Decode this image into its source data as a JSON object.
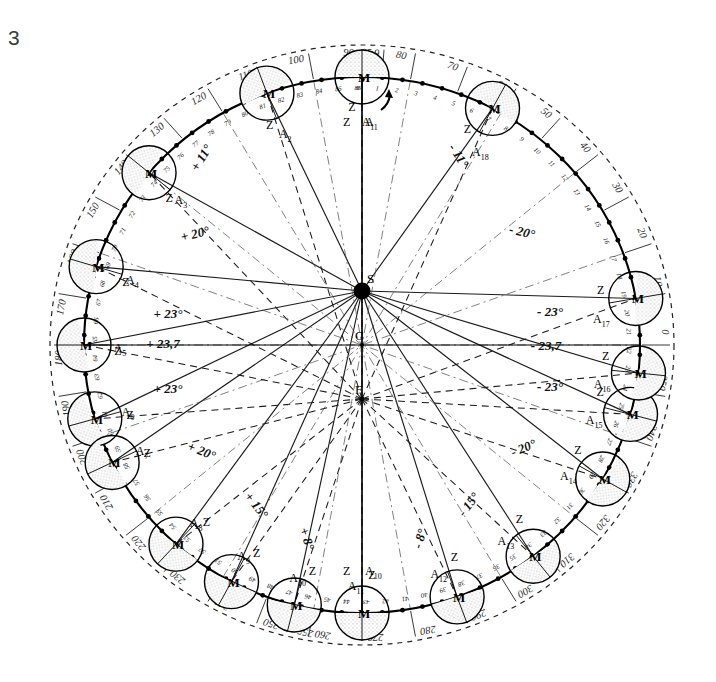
{
  "figure": {
    "number": "3",
    "caption_number": "3"
  },
  "focal_points": [
    {
      "id": "S",
      "label": "S",
      "x": 362,
      "y": 291,
      "kind": "sun",
      "filled": true
    },
    {
      "id": "C",
      "label": "C",
      "x": 362,
      "y": 345,
      "kind": "center",
      "filled": false
    },
    {
      "id": "F",
      "label": "F",
      "x": 362,
      "y": 399,
      "kind": "focus",
      "filled": false
    }
  ],
  "orbit": {
    "cx": 362,
    "cy": 345,
    "rx": 278,
    "ry": 268,
    "outer_dashed_rx": 312,
    "outer_dashed_ry": 300
  },
  "angle_rays": {
    "left": [
      "+ 11°",
      "+ 20°",
      "+ 23°",
      "+ 23,7",
      "+ 23°",
      "+ 20°",
      "+ 15°",
      "+ 8°"
    ],
    "right": [
      "- 11°",
      "- 20°",
      "- 23°",
      "- 23,7",
      "- 23°",
      "- 20°",
      "- 15°",
      "- 8°"
    ],
    "values_left": [
      {
        "text": "+ 11°",
        "x": 205,
        "y": 160,
        "rot": -58
      },
      {
        "text": "+ 20°",
        "x": 196,
        "y": 238,
        "rot": -14
      },
      {
        "text": "+ 23°",
        "x": 168,
        "y": 318,
        "rot": 0
      },
      {
        "text": "+ 23,7",
        "x": 163,
        "y": 348,
        "rot": 0
      },
      {
        "text": "+ 23°",
        "x": 168,
        "y": 393,
        "rot": 0
      },
      {
        "text": "+ 20°",
        "x": 200,
        "y": 455,
        "rot": 22
      },
      {
        "text": "+ 15°",
        "x": 253,
        "y": 508,
        "rot": 52
      },
      {
        "text": "+ 8°",
        "x": 303,
        "y": 540,
        "rot": 72
      }
    ],
    "values_right": [
      {
        "text": "- 11°",
        "x": 455,
        "y": 158,
        "rot": 58
      },
      {
        "text": "- 20°",
        "x": 521,
        "y": 236,
        "rot": 14
      },
      {
        "text": "- 23°",
        "x": 550,
        "y": 316,
        "rot": 0
      },
      {
        "text": "- 23,7",
        "x": 546,
        "y": 350,
        "rot": 0
      },
      {
        "text": "- 23°",
        "x": 550,
        "y": 391,
        "rot": 0
      },
      {
        "text": "- 20°",
        "x": 525,
        "y": 452,
        "rot": -22
      },
      {
        "text": "- 15°",
        "x": 472,
        "y": 507,
        "rot": -52
      },
      {
        "text": "- 8°",
        "x": 424,
        "y": 540,
        "rot": -72
      }
    ]
  },
  "graduations": {
    "unit": "degrees",
    "labels": [
      "0",
      "10",
      "20",
      "30",
      "40",
      "50",
      "60",
      "70",
      "80",
      "85,9",
      "90",
      "100",
      "110",
      "120",
      "130",
      "140",
      "150",
      "160",
      "170",
      "180",
      "190",
      "200",
      "210",
      "220",
      "230",
      "240",
      "250",
      "255,9",
      "260",
      "270",
      "280",
      "290",
      "300",
      "310",
      "320",
      "330",
      "340",
      "350"
    ],
    "special": [
      "85,9",
      "255,9"
    ],
    "ring_entries": [
      {
        "text": "90",
        "deg": 90
      },
      {
        "text": "85,9",
        "deg": 85.9
      },
      {
        "text": "80",
        "deg": 80
      },
      {
        "text": "70",
        "deg": 70
      },
      {
        "text": "60",
        "deg": 60
      },
      {
        "text": "50",
        "deg": 50
      },
      {
        "text": "40",
        "deg": 40
      },
      {
        "text": "30",
        "deg": 30
      },
      {
        "text": "20",
        "deg": 20
      },
      {
        "text": "10",
        "deg": 10
      },
      {
        "text": "0",
        "deg": 0
      },
      {
        "text": "350",
        "deg": 350
      },
      {
        "text": "340",
        "deg": 340
      },
      {
        "text": "330",
        "deg": 330
      },
      {
        "text": "320",
        "deg": 320
      },
      {
        "text": "310",
        "deg": 310
      },
      {
        "text": "300",
        "deg": 300
      },
      {
        "text": "290",
        "deg": 290
      },
      {
        "text": "280",
        "deg": 280
      },
      {
        "text": "270",
        "deg": 270
      },
      {
        "text": "260",
        "deg": 260
      },
      {
        "text": "255,9",
        "deg": 255.9
      },
      {
        "text": "250",
        "deg": 250
      },
      {
        "text": "240",
        "deg": 240
      },
      {
        "text": "230",
        "deg": 230
      },
      {
        "text": "220",
        "deg": 220
      },
      {
        "text": "210",
        "deg": 210
      },
      {
        "text": "200",
        "deg": 200
      },
      {
        "text": "190",
        "deg": 190
      },
      {
        "text": "180",
        "deg": 180
      },
      {
        "text": "170",
        "deg": 170
      },
      {
        "text": "160",
        "deg": 160
      },
      {
        "text": "150",
        "deg": 150
      },
      {
        "text": "140",
        "deg": 140
      },
      {
        "text": "130",
        "deg": 130
      },
      {
        "text": "120",
        "deg": 120
      },
      {
        "text": "110",
        "deg": 110
      },
      {
        "text": "100",
        "deg": 100
      }
    ]
  },
  "bodies": {
    "count": 18,
    "moon_letter": "M",
    "zenith_letter": "Z",
    "apex_letter": "A",
    "positions": [
      {
        "index": 1,
        "a_label": "A",
        "a_sub": "1",
        "deg": 90,
        "tick": "0"
      },
      {
        "index": 2,
        "a_label": "A",
        "a_sub": "2",
        "deg": 110,
        "tick": "5"
      },
      {
        "index": 3,
        "a_label": "A",
        "a_sub": "3",
        "deg": 140,
        "tick": "11"
      },
      {
        "index": 4,
        "a_label": "A",
        "a_sub": "4",
        "deg": 163,
        "tick": "17"
      },
      {
        "index": 5,
        "a_label": "A",
        "a_sub": "5",
        "deg": 180,
        "tick": "20"
      },
      {
        "index": 6,
        "a_label": "A",
        "a_sub": "6",
        "deg": 196,
        "tick": "22"
      },
      {
        "index": 7,
        "a_label": "A",
        "a_sub": "7",
        "deg": 206,
        "tick": "26"
      },
      {
        "index": 8,
        "a_label": "A",
        "a_sub": "8",
        "deg": 228,
        "tick": "33"
      },
      {
        "index": 9,
        "a_label": "A",
        "a_sub": "9",
        "deg": 242,
        "tick": "38"
      },
      {
        "index": 10,
        "a_label": "A",
        "a_sub": "10",
        "deg": 255.9,
        "tick": "44"
      },
      {
        "index": 11,
        "a_label": "A",
        "a_sub": "11",
        "deg": 270,
        "tick": "50"
      },
      {
        "index": 12,
        "a_label": "A",
        "a_sub": "12",
        "deg": 290,
        "tick": "55"
      },
      {
        "index": 13,
        "a_label": "A",
        "a_sub": "13",
        "deg": 308,
        "tick": "61"
      },
      {
        "index": 14,
        "a_label": "A",
        "a_sub": "14",
        "deg": 330,
        "tick": "66"
      },
      {
        "index": 15,
        "a_label": "A",
        "a_sub": "15",
        "deg": 345,
        "tick": "69"
      },
      {
        "index": 16,
        "a_label": "A",
        "a_sub": "16",
        "deg": 354,
        "tick": "72"
      },
      {
        "index": 17,
        "a_label": "A",
        "a_sub": "17",
        "deg": 10,
        "tick": "76"
      },
      {
        "index": 18,
        "a_label": "A",
        "a_sub": "18",
        "deg": 62,
        "tick": "82"
      }
    ]
  },
  "tick_marks": {
    "total": 87,
    "first": "0",
    "last": "86",
    "numbers": [
      "0",
      "1",
      "2",
      "3",
      "4",
      "5",
      "6",
      "7",
      "8",
      "9",
      "10",
      "11",
      "12",
      "13",
      "14",
      "15",
      "16",
      "17",
      "18",
      "19",
      "20",
      "21",
      "22",
      "23",
      "24",
      "25",
      "26",
      "27",
      "28",
      "29",
      "30",
      "31",
      "32",
      "33",
      "34",
      "35",
      "36",
      "37",
      "38",
      "39",
      "40",
      "41",
      "42",
      "43",
      "44",
      "45",
      "46",
      "47",
      "48",
      "49",
      "50",
      "51",
      "52",
      "53",
      "54",
      "55",
      "56",
      "57",
      "58",
      "59",
      "60",
      "61",
      "62",
      "63",
      "64",
      "65",
      "66",
      "67",
      "68",
      "69",
      "70",
      "71",
      "72",
      "73",
      "74",
      "75",
      "76",
      "77",
      "78",
      "79",
      "80",
      "81",
      "82",
      "83",
      "84",
      "85",
      "86"
    ]
  },
  "colors": {
    "ink": "#111111",
    "paper": "#ffffff",
    "shade": "#cfcfcf",
    "faint": "#5a5a5a"
  }
}
